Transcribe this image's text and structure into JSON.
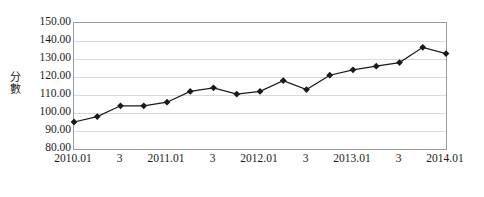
{
  "chart_data": {
    "type": "line",
    "title": "",
    "xlabel": "",
    "ylabel": "分數",
    "ylim": [
      80,
      150
    ],
    "ytick_values": [
      80,
      90,
      100,
      110,
      120,
      130,
      140,
      150
    ],
    "ytick_labels": [
      "80.00",
      "90.00",
      "100.00",
      "110.00",
      "120.00",
      "130.00",
      "140.00",
      "150.00"
    ],
    "grid": true,
    "legend": "none",
    "marker": "diamond",
    "line_color": "#1a1a1a",
    "marker_color": "#1a1a1a",
    "grid_color": "#d9d9d9",
    "axis_color": "#9a9a9a",
    "xtick_labels": [
      "2010.01",
      "3",
      "2011.01",
      "3",
      "2012.01",
      "3",
      "2013.01",
      "3",
      "2014.01"
    ],
    "xtick_index": [
      0,
      2,
      4,
      6,
      8,
      10,
      12,
      14,
      16
    ],
    "x": [
      0,
      1,
      2,
      3,
      4,
      5,
      6,
      7,
      8,
      9,
      10,
      11,
      12,
      13,
      14,
      15,
      16
    ],
    "values": [
      95.0,
      98.0,
      104.0,
      104.0,
      106.0,
      112.0,
      114.0,
      110.5,
      112.0,
      118.0,
      113.0,
      121.0,
      124.0,
      126.0,
      128.0,
      136.5,
      133.0
    ]
  }
}
